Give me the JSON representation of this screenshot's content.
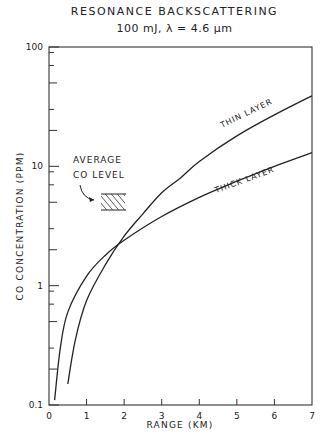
{
  "chart_data": {
    "type": "line",
    "title": "RESONANCE BACKSCATTERING",
    "subtitle": "100 mJ, λ = 4.6 µm",
    "xlabel": "RANGE (KM)",
    "ylabel": "CO CONCENTRATION (PPM)",
    "xlim": [
      0,
      7
    ],
    "ylim": [
      0.1,
      100
    ],
    "yscale": "log",
    "x_ticks": [
      "0",
      "1",
      "2",
      "3",
      "4",
      "5",
      "6",
      "7"
    ],
    "y_ticks": [
      "0.1",
      "1",
      "10",
      "100"
    ],
    "grid": false,
    "series": [
      {
        "name": "THIN LAYER",
        "x": [
          0.5,
          0.7,
          1.0,
          1.5,
          2.0,
          2.5,
          3.0,
          3.5,
          4.0,
          5.0,
          6.0,
          7.0
        ],
        "y": [
          0.15,
          0.35,
          0.75,
          1.5,
          2.6,
          4.0,
          6.0,
          8.0,
          11,
          18,
          27,
          39
        ]
      },
      {
        "name": "THICK LAYER",
        "x": [
          0.15,
          0.3,
          0.5,
          1.0,
          1.5,
          2.0,
          3.0,
          4.0,
          5.0,
          6.0,
          7.0
        ],
        "y": [
          0.11,
          0.3,
          0.6,
          1.2,
          1.8,
          2.4,
          3.8,
          5.5,
          7.5,
          10,
          13
        ]
      }
    ],
    "annotations": [
      {
        "text": "AVERAGE CO LEVEL",
        "x": 1.1,
        "y": 5.3,
        "kind": "hatched band"
      }
    ]
  },
  "labels": {
    "title": "RESONANCE BACKSCATTERING",
    "subtitle": "100 mJ, λ = 4.6 µm",
    "xlabel": "RANGE (KM)",
    "ylabel": "CO CONCENTRATION (PPM)",
    "thin": "THIN LAYER",
    "thick": "THICK LAYER",
    "avg1": "AVERAGE",
    "avg2": "CO LEVEL"
  }
}
